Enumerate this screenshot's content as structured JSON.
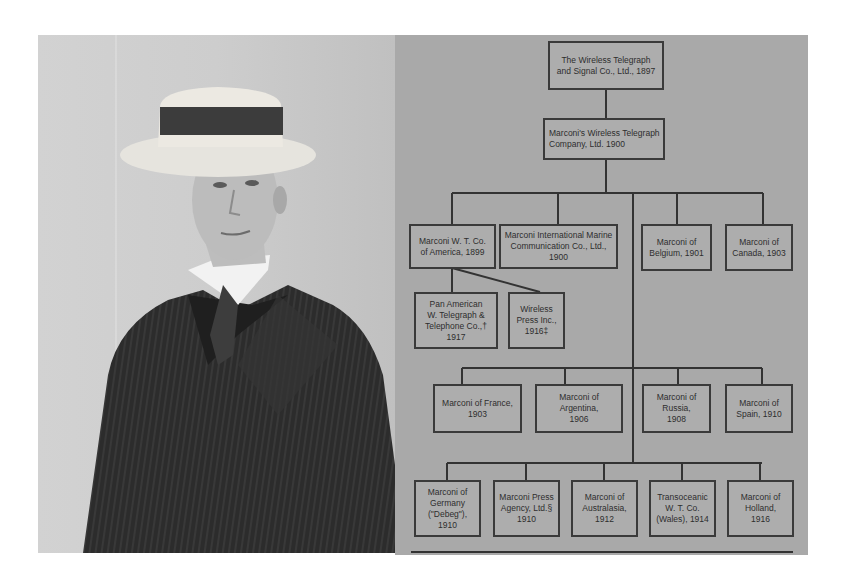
{
  "photo": {
    "subject": "portrait of man in straw boater hat and pinstripe suit",
    "colors": {
      "background": "#cccccc",
      "suit": "#2a2a2a",
      "hat": "#e8e6e0",
      "hat_band": "#3a3a3a"
    }
  },
  "org_chart": {
    "root": {
      "label": "The Wireless Telegraph\nand Signal Co., Ltd., 1897"
    },
    "parent": {
      "label": "Marconi's Wireless Telegraph\nCompany, Ltd.          1900"
    },
    "tier1": [
      {
        "label": "Marconi W. T. Co.\nof America, 1899"
      },
      {
        "label": "Marconi International Marine\nCommunication Co., Ltd., 1900"
      },
      {
        "label": "Marconi of\nBelgium, 1901"
      },
      {
        "label": "Marconi of\nCanada, 1903"
      }
    ],
    "america_children": [
      {
        "label": "Pan American\nW. Telegraph &\nTelephone Co.,† 1917"
      },
      {
        "label": "Wireless\nPress Inc.,\n1916‡"
      }
    ],
    "tier2": [
      {
        "label": "Marconi of France,\n1903"
      },
      {
        "label": "Marconi of Argentina,\n1906"
      },
      {
        "label": "Marconi of Russia,\n1908"
      },
      {
        "label": "Marconi of\nSpain, 1910"
      }
    ],
    "tier3": [
      {
        "label": "Marconi of\nGermany\n(\"Debeg\"), 1910"
      },
      {
        "label": "Marconi Press\nAgency, Ltd.§\n1910"
      },
      {
        "label": "Marconi of\nAustralasia,\n1912"
      },
      {
        "label": "Transoceanic\nW. T. Co.\n(Wales), 1914"
      },
      {
        "label": "Marconi of\nHolland,\n1916"
      }
    ],
    "colors": {
      "paper": "#a9a9a9",
      "ink": "#333333"
    }
  }
}
